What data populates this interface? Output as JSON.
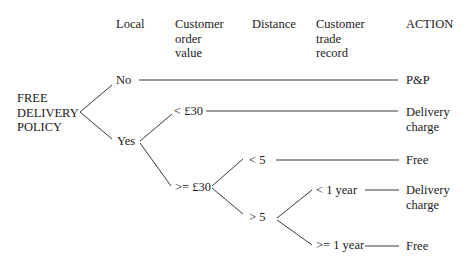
{
  "headers": {
    "local": "Local",
    "order_value": "Customer\norder\nvalue",
    "distance": "Distance",
    "trade_record": "Customer\ntrade\nrecord",
    "action": "ACTION"
  },
  "root": "FREE\nDELIVERY\nPOLICY",
  "nodes": {
    "local_no": "No",
    "local_yes": "Yes",
    "order_lt30": "< £30",
    "order_ge30": ">= £30",
    "distance_lt5": "< 5",
    "distance_gt5": "> 5",
    "record_lt1": "< 1 year",
    "record_ge1": ">= 1 year"
  },
  "actions": {
    "no_local": "P&P",
    "lt30": "Delivery\ncharge",
    "lt5": "Free",
    "lt1year": "Delivery\ncharge",
    "ge1year": "Free"
  }
}
